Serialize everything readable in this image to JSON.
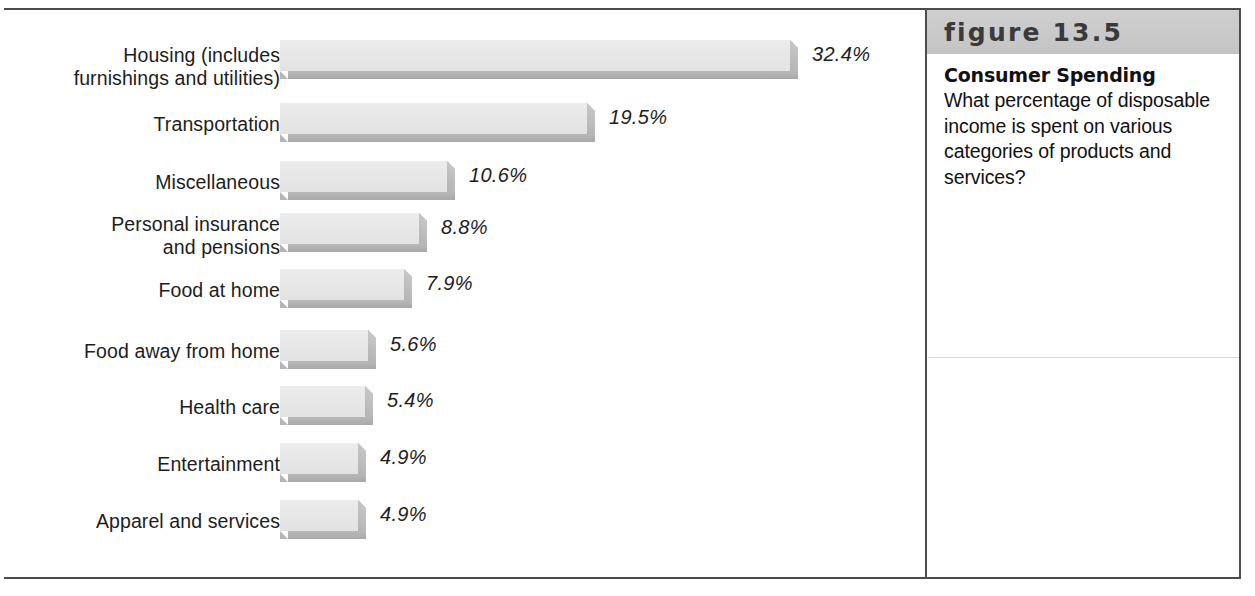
{
  "figure": {
    "header_label": "figure 13.5",
    "caption_title": "Consumer Spending",
    "caption_body": "What percentage of disposable income is spent on various categories of products and services?"
  },
  "chart_data": {
    "type": "bar",
    "orientation": "horizontal",
    "title": "Consumer Spending",
    "xlabel": "",
    "ylabel": "",
    "value_suffix": "%",
    "grid": false,
    "legend": false,
    "xlim": [
      0,
      32.4
    ],
    "categories": [
      "Housing (includes\nfurnishings and utilities)",
      "Transportation",
      "Miscellaneous",
      "Personal insurance\nand pensions",
      "Food at home",
      "Food away from home",
      "Health care",
      "Entertainment",
      "Apparel and services"
    ],
    "values": [
      32.4,
      19.5,
      10.6,
      8.8,
      7.9,
      5.6,
      5.4,
      4.9,
      4.9
    ],
    "value_labels": [
      "32.4%",
      "19.5%",
      "10.6%",
      "8.8%",
      "7.9%",
      "5.6%",
      "5.4%",
      "4.9%",
      "4.9%"
    ],
    "colors": {
      "bar_face": "#e9e9e9",
      "bar_shadow": "#b2b2b2",
      "text": "#1d1d1d",
      "header_band": "#c9c9c9",
      "frame": "#4c4c4c"
    }
  },
  "rows": [
    {
      "label": "Housing (includes\nfurnishings and utilities)",
      "value_label": "32.4%",
      "value": 32.4,
      "top": 30,
      "label_top": 4,
      "bar_px": 510
    },
    {
      "label": "Transportation",
      "value_label": "19.5%",
      "value": 19.5,
      "top": 93,
      "label_top": 10,
      "bar_px": 307
    },
    {
      "label": "Miscellaneous",
      "value_label": "10.6%",
      "value": 10.6,
      "top": 151,
      "label_top": 10,
      "bar_px": 167
    },
    {
      "label": "Personal insurance\nand pensions",
      "value_label": "8.8%",
      "value": 8.8,
      "top": 203,
      "label_top": 0,
      "bar_px": 139
    },
    {
      "label": "Food at home",
      "value_label": "7.9%",
      "value": 7.9,
      "top": 259,
      "label_top": 10,
      "bar_px": 124
    },
    {
      "label": "Food away from home",
      "value_label": "5.6%",
      "value": 5.6,
      "top": 320,
      "label_top": 10,
      "bar_px": 88
    },
    {
      "label": "Health care",
      "value_label": "5.4%",
      "value": 5.4,
      "top": 376,
      "label_top": 10,
      "bar_px": 85
    },
    {
      "label": "Entertainment",
      "value_label": "4.9%",
      "value": 4.9,
      "top": 433,
      "label_top": 10,
      "bar_px": 78
    },
    {
      "label": "Apparel and services",
      "value_label": "4.9%",
      "value": 4.9,
      "top": 490,
      "label_top": 10,
      "bar_px": 78
    }
  ]
}
